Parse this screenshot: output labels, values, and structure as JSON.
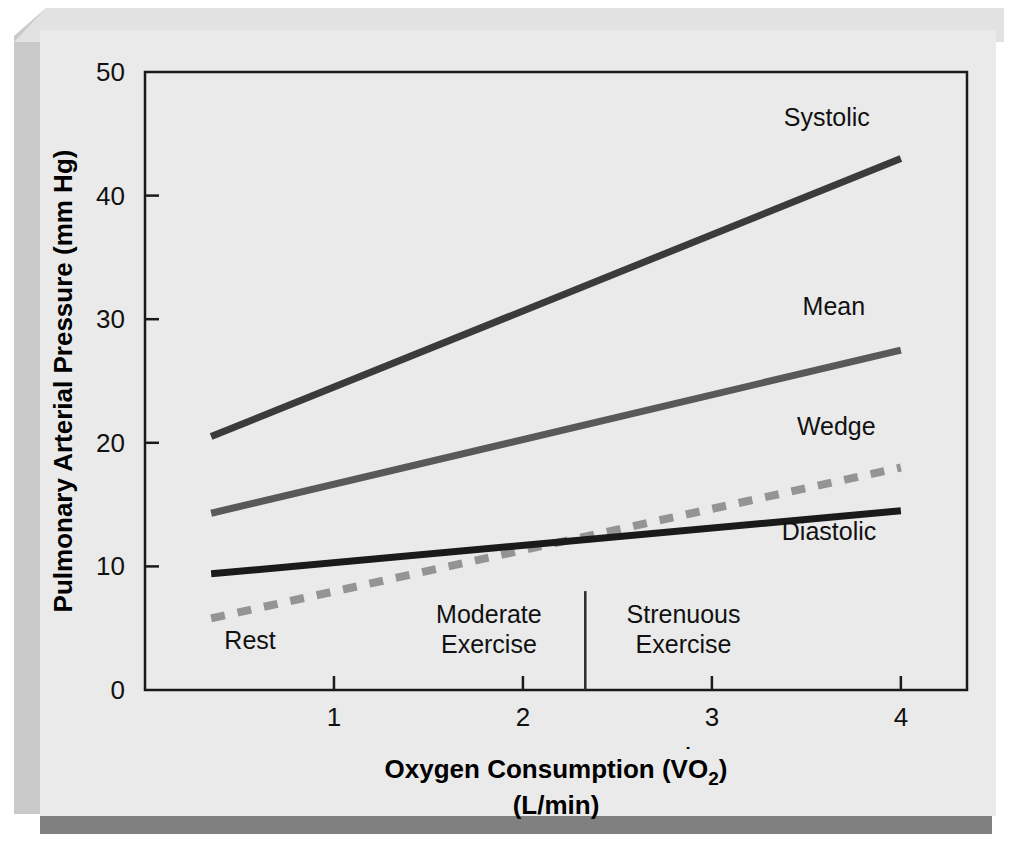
{
  "figure": {
    "background_color": "#eaeaea",
    "panel_shadow_color": "#808080"
  },
  "chart_data": {
    "type": "line",
    "title": "",
    "xlabel": "Oxygen Consumption (V̇O2)",
    "xlabel_line2": "(L/min)",
    "xlabel_main": "Oxygen Consumption (",
    "xlabel_symbol": "V",
    "xlabel_sub": "O",
    "xlabel_sub2": "2",
    "xlabel_close": ")",
    "ylabel": "Pulmonary Arterial Pressure (mm Hg)",
    "xlim": [
      0,
      4.35
    ],
    "ylim": [
      0,
      50
    ],
    "xticks": [
      1,
      2,
      3,
      4
    ],
    "xtick_labels": [
      "1",
      "2",
      "3",
      "4"
    ],
    "yticks": [
      0,
      10,
      20,
      30,
      40,
      50
    ],
    "ytick_labels": [
      "0",
      "10",
      "20",
      "30",
      "40",
      "50"
    ],
    "grid": false,
    "legend_position": "inline-right-labels",
    "x_start": 0.35,
    "x_end": 4.0,
    "series": [
      {
        "name": "Systolic",
        "label": "Systolic",
        "style": "solid",
        "color": "#3b3b3b",
        "width": 7,
        "x": [
          0.35,
          4.0
        ],
        "values": [
          20.5,
          43.0
        ],
        "label_x": 3.38,
        "label_y": 45.6
      },
      {
        "name": "Mean",
        "label": "Mean",
        "style": "solid",
        "color": "#595959",
        "width": 7,
        "x": [
          0.35,
          4.0
        ],
        "values": [
          14.3,
          27.5
        ],
        "label_x": 3.48,
        "label_y": 30.3
      },
      {
        "name": "Wedge",
        "label": "Wedge",
        "style": "dashed",
        "color": "#949494",
        "width": 8,
        "x": [
          0.35,
          4.0
        ],
        "values": [
          5.8,
          18.0
        ],
        "label_x": 3.45,
        "label_y": 20.6
      },
      {
        "name": "Diastolic",
        "label": "Diastolic",
        "style": "solid",
        "color": "#1a1a1a",
        "width": 7,
        "x": [
          0.35,
          4.0
        ],
        "values": [
          9.4,
          14.5
        ],
        "label_x": 3.37,
        "label_y": 12.1
      }
    ],
    "annotations": [
      {
        "name": "rest",
        "text": "Rest",
        "x": 0.42,
        "y": 3.3,
        "anchor": "start"
      },
      {
        "name": "moderate-exercise",
        "text_line1": "Moderate",
        "text_line2": "Exercise",
        "x": 1.82,
        "y": 5.4,
        "anchor": "middle"
      },
      {
        "name": "strenuous-exercise",
        "text_line1": "Strenuous",
        "text_line2": "Exercise",
        "x": 2.85,
        "y": 5.4,
        "anchor": "middle"
      }
    ],
    "divider": {
      "name": "exercise-zone-divider",
      "x": 2.33,
      "y_top": 8.0,
      "y_bottom": 0
    }
  }
}
